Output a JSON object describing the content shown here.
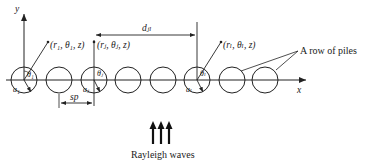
{
  "diagram": {
    "axes": {
      "x_label": "x",
      "y_label": "y"
    },
    "points": [
      {
        "id": "p1",
        "label": "(r₁, θ₁, z)"
      },
      {
        "id": "pj",
        "label": "(rⱼ, θⱼ, z)"
      },
      {
        "id": "pl",
        "label": "(rₗ, θₗ, z)"
      }
    ],
    "pile_labels": {
      "theta_1": "θ₁",
      "a_1": "a₁",
      "theta_j": "θⱼ",
      "a_j": "aⱼ",
      "theta_l": "θₗ",
      "a_l": "aₗ"
    },
    "dimensions": {
      "spacing": "sp",
      "distance": "dⱼₗ"
    },
    "annotation": "A row of piles",
    "wave_label": "Rayleigh waves",
    "pile_count": 8,
    "colors": {
      "stroke": "#222222",
      "background": "#ffffff"
    }
  }
}
